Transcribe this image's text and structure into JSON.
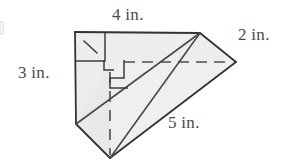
{
  "figure": {
    "kind": "geometry-diagram",
    "fill_color": "#ececec",
    "fill_color_light": "#f4f4f4",
    "stroke_color": "#3a3a3a",
    "label_color": "#4a4a4a",
    "dashed_color": "#555555",
    "edge_margin_mark_color": "#cccccc",
    "labels": {
      "top": "4 in.",
      "right": "2 in.",
      "left": "3 in.",
      "bottom": "5 in."
    },
    "vertices": {
      "top_left": "75,32",
      "top_right": "200,33",
      "far_right": "236,62",
      "bottom_left": "76,124",
      "bottom_point": "110,158",
      "hidden_center": "110,62"
    },
    "right_angle_marks": 3,
    "units": "in."
  }
}
